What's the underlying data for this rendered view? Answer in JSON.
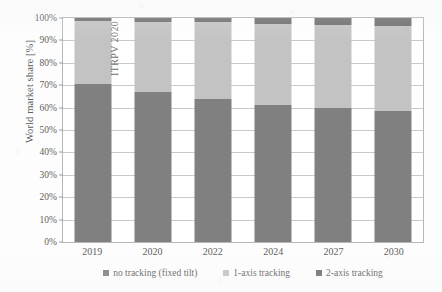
{
  "chart_data": {
    "type": "bar",
    "subtype": "stacked-bar-100",
    "title": "",
    "xlabel": "",
    "ylabel": "World market share [%]",
    "categories": [
      "2019",
      "2020",
      "2022",
      "2024",
      "2027",
      "2030"
    ],
    "series": [
      {
        "name": "no tracking (fixed tilt)",
        "color": "#808080",
        "values": [
          70.5,
          67.0,
          64.0,
          61.0,
          60.0,
          58.5
        ]
      },
      {
        "name": "1-axis tracking",
        "color": "#c3c3c3",
        "values": [
          28.0,
          31.0,
          34.0,
          36.5,
          37.0,
          38.0
        ]
      },
      {
        "name": "2-axis tracking",
        "color": "#6f6f6f",
        "values": [
          1.5,
          2.0,
          2.0,
          2.5,
          3.0,
          3.5
        ]
      }
    ],
    "ylim": [
      0,
      100
    ],
    "yticks": [
      "0%",
      "10%",
      "20%",
      "30%",
      "40%",
      "50%",
      "60%",
      "70%",
      "80%",
      "90%",
      "100%"
    ],
    "ytick_values": [
      0,
      10,
      20,
      30,
      40,
      50,
      60,
      70,
      80,
      90,
      100
    ],
    "grid": true,
    "legend_position": "bottom",
    "annotations": [
      {
        "text": "ITRPV 2020",
        "orientation": "vertical"
      }
    ]
  },
  "legend": {
    "items": [
      {
        "label": "no tracking (fixed tilt)",
        "color": "#808080"
      },
      {
        "label": "1-axis tracking",
        "color": "#c3c3c3"
      },
      {
        "label": "2-axis tracking",
        "color": "#6f6f6f"
      }
    ]
  },
  "colors": {
    "no_tracking": "#808080",
    "one_axis": "#c3c3c3",
    "two_axis": "#6f6f6f",
    "grid": "#c9c9c9",
    "frame": "#b7b7b7",
    "text": "#5d5d5f",
    "background": "#ffffff"
  }
}
